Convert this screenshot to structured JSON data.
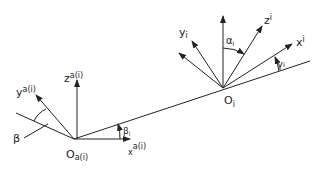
{
  "diagram": {
    "type": "coordinate-frames",
    "stroke_color": "#222222",
    "background": "#ffffff",
    "origins": {
      "base": {
        "label": "O",
        "sub": "a(i)"
      },
      "local": {
        "label": "O",
        "sub": "i"
      }
    },
    "base_frame": {
      "x_axis": {
        "label": "x",
        "sup": "a(i)"
      },
      "y_axis": {
        "label": "y",
        "sup": "a(i)"
      },
      "z_axis": {
        "label": "z",
        "sup": "a(i)"
      }
    },
    "local_frame": {
      "x_axis": {
        "label": "x",
        "sup": "i"
      },
      "y_axis": {
        "label": "y",
        "sub": "i"
      },
      "z_axis": {
        "label": "z",
        "sup": "i"
      }
    },
    "angles": {
      "alpha": {
        "label": "α",
        "sub": "i"
      },
      "gamma": {
        "label": "γ",
        "sub": "i"
      },
      "beta_i": {
        "label": "β",
        "sub": "i"
      },
      "beta": {
        "label": "β"
      }
    }
  }
}
